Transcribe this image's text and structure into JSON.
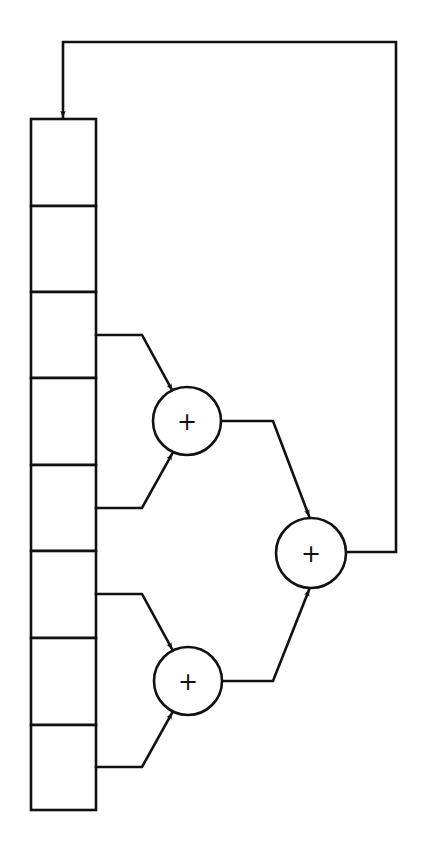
{
  "diagram": {
    "title": "",
    "colors": {
      "stroke": "#111111",
      "background": "#ffffff"
    },
    "register": {
      "cells": [
        {
          "index": 0,
          "label": ""
        },
        {
          "index": 1,
          "label": ""
        },
        {
          "index": 2,
          "label": ""
        },
        {
          "index": 3,
          "label": ""
        },
        {
          "index": 4,
          "label": ""
        },
        {
          "index": 5,
          "label": ""
        },
        {
          "index": 6,
          "label": ""
        },
        {
          "index": 7,
          "label": ""
        }
      ]
    },
    "adders": [
      {
        "id": "adder-1",
        "symbol": "+",
        "inputs": [
          "cell-3",
          "cell-5"
        ]
      },
      {
        "id": "adder-2",
        "symbol": "+",
        "inputs": [
          "cell-6",
          "cell-8"
        ]
      },
      {
        "id": "adder-3",
        "symbol": "+",
        "inputs": [
          "adder-1",
          "adder-2"
        ]
      }
    ],
    "feedback": {
      "from": "adder-3",
      "to": "cell-1"
    }
  }
}
